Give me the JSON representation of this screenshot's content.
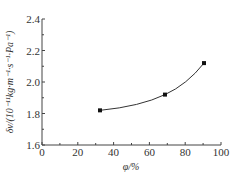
{
  "chart_data": {
    "type": "line",
    "title": "",
    "xlabel": "φ/%",
    "ylabel": "δ_v/(10⁻¹¹kg·m⁻¹·s⁻¹·Pa⁻¹)",
    "x": [
      32.4,
      68.7,
      90.5
    ],
    "series": [
      {
        "name": "measured",
        "values": [
          1.82,
          1.92,
          2.12
        ],
        "marker": "square",
        "line": "smooth fit"
      }
    ],
    "xlim": [
      0,
      100
    ],
    "ylim": [
      1.6,
      2.4
    ],
    "x_ticks": [
      "0",
      "20",
      "40",
      "60",
      "80",
      "100"
    ],
    "y_ticks": [
      "1.6",
      "1.8",
      "2.0",
      "2.2",
      "2.4"
    ],
    "grid": false,
    "legend": null
  },
  "axes": {
    "x_label": "φ/%",
    "y_label": "δv/(10⁻¹¹kg·m⁻¹·s⁻¹·Pa⁻¹)"
  }
}
